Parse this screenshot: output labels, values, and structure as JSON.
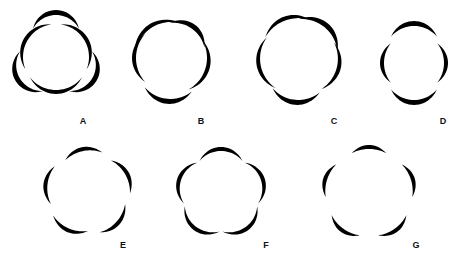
{
  "figure": {
    "ink_color": "#000000",
    "background": "#ffffff",
    "panels": [
      {
        "label": "A",
        "petals": 6,
        "arrangement": "two whorls of 3, outer petals overlapping inner",
        "cx": 56,
        "cy": 57,
        "r": 38,
        "label_x": 83,
        "label_y": 121
      },
      {
        "label": "B",
        "petals": 5,
        "arrangement": "imbricate-like, irregular overlap",
        "cx": 171,
        "cy": 58,
        "r": 40,
        "label_x": 201,
        "label_y": 121
      },
      {
        "label": "C",
        "petals": 5,
        "arrangement": "imbricate, overlapping margins",
        "cx": 299,
        "cy": 58,
        "r": 40,
        "label_x": 334,
        "label_y": 121
      },
      {
        "label": "D",
        "petals": 4,
        "arrangement": "two pairs, decussate",
        "cx": 414,
        "cy": 62,
        "r": 32,
        "label_x": 443,
        "label_y": 121
      },
      {
        "label": "E",
        "petals": 5,
        "arrangement": "contorted / convolute",
        "cx": 88,
        "cy": 192,
        "r": 40,
        "label_x": 123,
        "label_y": 245
      },
      {
        "label": "F",
        "petals": 5,
        "arrangement": "valvate, touching edges forming lobed outline",
        "cx": 221,
        "cy": 193,
        "r": 42,
        "label_x": 266,
        "label_y": 245
      },
      {
        "label": "G",
        "petals": 5,
        "arrangement": "open, petals separated",
        "cx": 369,
        "cy": 193,
        "r": 42,
        "label_x": 416,
        "label_y": 245
      }
    ]
  }
}
